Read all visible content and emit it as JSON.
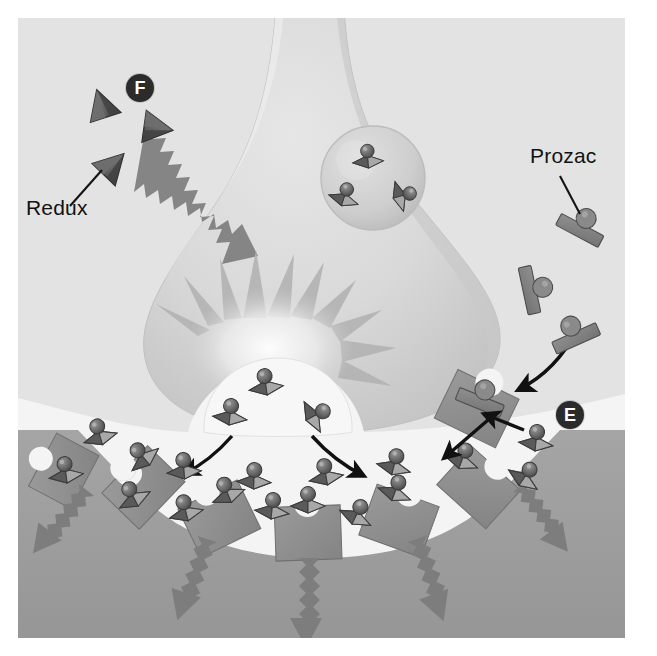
{
  "figure": {
    "background_color": "#e3e3e3",
    "panel": {
      "x": 18,
      "y": 18,
      "width": 607,
      "height": 620
    }
  },
  "labels": {
    "redux": "Redux",
    "prozac": "Prozac"
  },
  "badges": {
    "f": "F",
    "e": "E"
  },
  "colors": {
    "panel_bg": "#e3e3e3",
    "presynaptic_fill": "#dcdcdc",
    "presynaptic_shade": "#cfcfcf",
    "cleft_fill": "#f2f2f2",
    "postsynaptic_fill": "#9d9d9d",
    "receptor_fill": "#8d8d8d",
    "transporter_fill": "#8d8d8d",
    "molecule_dark": "#5e5e5e",
    "molecule_light": "#b4b4b4",
    "arrow_gray": "#777777",
    "arrow_black": "#111111",
    "badge_bg": "#2b2b2b",
    "badge_text": "#ffffff",
    "label_text": "#121212",
    "vesicle_fill": "#d2d2d2"
  },
  "elements": {
    "presynaptic_terminal": "presynaptic-neuron-terminal",
    "vesicle": "synaptic-vesicle",
    "vesicle_contents_count": 3,
    "fusing_vesicle": "fusing-vesicle-release-site",
    "starburst": "release-burst",
    "synaptic_cleft": "synaptic-cleft",
    "postsynaptic_cell": "postsynaptic-neuron",
    "receptor_count": 6,
    "signal_arrow_count": 5,
    "redux_particle_count": 3,
    "prozac_molecule_count": 3,
    "serotonin_in_cleft_count": 16,
    "release_arrow_count": 2,
    "reuptake_arrow_count": 2,
    "prozac_entry_arrow": "prozac-entry-arrow",
    "redux_jagged_arrow": "redux-stimulation-arrow",
    "blocked_transporter": "prozac-blocked-transporter"
  },
  "legend_meaning": {
    "F": "Redux stimulates serotonin release from the presynaptic terminal",
    "E": "Prozac blocks the serotonin reuptake transporter"
  }
}
